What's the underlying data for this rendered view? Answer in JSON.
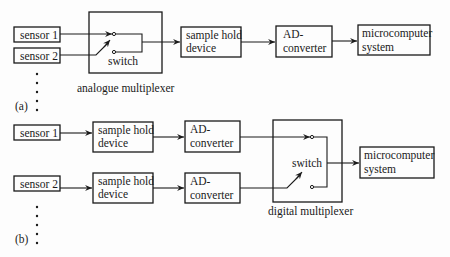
{
  "part_a": {
    "label": "(a)",
    "sensors": [
      {
        "label": "sensor 1"
      },
      {
        "label": "sensor 2"
      }
    ],
    "multiplexer": {
      "switch_label": "switch",
      "caption": "analogue multiplexer"
    },
    "sample_hold": {
      "line1": "sample hold",
      "line2": "device"
    },
    "ad_converter": {
      "line1": "AD-",
      "line2": "converter"
    },
    "microcomputer": {
      "line1": "microcomputer",
      "line2": "system"
    }
  },
  "part_b": {
    "label": "(b)",
    "channels": [
      {
        "sensor": "sensor 1",
        "sample_hold_line1": "sample hold",
        "sample_hold_line2": "device",
        "ad_line1": "AD-",
        "ad_line2": "converter"
      },
      {
        "sensor": "sensor 2",
        "sample_hold_line1": "sample hold",
        "sample_hold_line2": "device",
        "ad_line1": "AD-",
        "ad_line2": "converter"
      }
    ],
    "multiplexer": {
      "switch_label": "switch",
      "caption": "digital multiplexer"
    },
    "microcomputer": {
      "line1": "microcomputer",
      "line2": "system"
    }
  },
  "colors": {
    "ink": "#1a1a1a",
    "background": "#fdfdfd"
  }
}
